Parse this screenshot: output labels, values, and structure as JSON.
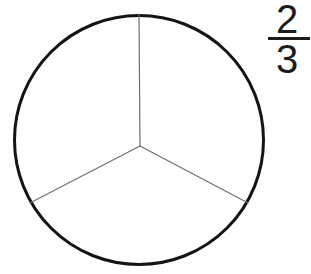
{
  "figure": {
    "name": "fraction-circle-diagram",
    "background_color": "#ffffff"
  },
  "fraction": {
    "numerator": "2",
    "denominator": "3",
    "text": "2/3",
    "bar_color": "#1c1c1c",
    "text_color": "#1c1c1c"
  },
  "circle": {
    "center_x": 139,
    "center_y": 140,
    "radius": 126,
    "stroke_color": "#141414",
    "stroke_width": 3,
    "fill_color": "#ffffff"
  },
  "sectors": {
    "count": 3,
    "shaded_count": 0,
    "angle_each_deg": 120,
    "divider_color": "#6f6f6f",
    "divider_width": 1.2,
    "radii_angles_deg": [
      90,
      210,
      330
    ],
    "vertex_x": 140,
    "vertex_y": 146
  },
  "chart_data": {
    "type": "pie",
    "title": "",
    "categories": [
      "Sector 1",
      "Sector 2",
      "Sector 3"
    ],
    "values": [
      1,
      1,
      1
    ],
    "labels": [
      "1/3",
      "1/3",
      "1/3"
    ],
    "total_parts": 3,
    "shaded_parts": 0,
    "fraction_shown": "2/3",
    "legend": "none",
    "grid": false
  }
}
